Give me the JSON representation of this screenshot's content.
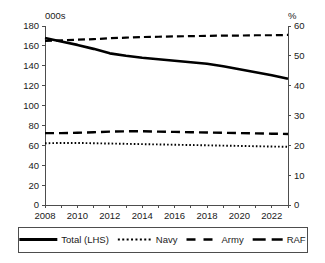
{
  "chart_data": {
    "type": "line",
    "title": "",
    "subtitle": "",
    "xlabel": "",
    "ylabel": "000s",
    "y2label": "%",
    "grid": false,
    "legend_position": "bottom",
    "x": [
      2008,
      2009,
      2010,
      2011,
      2012,
      2013,
      2014,
      2015,
      2016,
      2017,
      2018,
      2019,
      2020,
      2021,
      2022,
      2023
    ],
    "xlim": [
      2008,
      2023
    ],
    "ylim": [
      0,
      180
    ],
    "y2lim": [
      0,
      60
    ],
    "xticklabels": [
      "2008",
      "2010",
      "2012",
      "2014",
      "2016",
      "2018",
      "2020",
      "2022"
    ],
    "xtickvalues": [
      2008,
      2010,
      2012,
      2014,
      2016,
      2018,
      2020,
      2022
    ],
    "yticklabels": [
      "0",
      "20",
      "40",
      "60",
      "80",
      "100",
      "120",
      "140",
      "160",
      "180"
    ],
    "ytickvalues": [
      0,
      20,
      40,
      60,
      80,
      100,
      120,
      140,
      160,
      180
    ],
    "y2ticklabels": [
      "0",
      "10",
      "20",
      "30",
      "40",
      "50",
      "60"
    ],
    "y2tickvalues": [
      0,
      10,
      20,
      30,
      40,
      50,
      60
    ],
    "series": [
      {
        "name": "Total (LHS)",
        "axis": "left",
        "style": "solid",
        "color": "#000000",
        "values": [
          168.0,
          164.5,
          161.0,
          157.0,
          152.5,
          150.0,
          148.0,
          146.5,
          145.0,
          143.5,
          142.0,
          139.5,
          136.5,
          133.5,
          130.5,
          127.0
        ]
      },
      {
        "name": "Navy",
        "axis": "right",
        "style": "dotted",
        "color": "#000000",
        "values": [
          20.7,
          20.8,
          20.8,
          20.7,
          20.6,
          20.5,
          20.4,
          20.3,
          20.2,
          20.1,
          20.0,
          19.9,
          19.8,
          19.7,
          19.6,
          19.5
        ]
      },
      {
        "name": "Army",
        "axis": "right",
        "style": "dashed-long",
        "color": "#000000",
        "values": [
          24.1,
          24.1,
          24.2,
          24.4,
          24.6,
          24.7,
          24.7,
          24.6,
          24.5,
          24.4,
          24.3,
          24.2,
          24.1,
          24.0,
          23.9,
          23.8
        ]
      },
      {
        "name": "RAF",
        "axis": "right",
        "style": "dash-dot",
        "color": "#000000",
        "values": [
          55.0,
          55.2,
          55.4,
          55.6,
          55.9,
          56.1,
          56.3,
          56.4,
          56.5,
          56.6,
          56.7,
          56.8,
          56.8,
          56.9,
          56.9,
          57.0
        ]
      }
    ]
  },
  "legend": {
    "items": [
      {
        "label": "Total (LHS)",
        "style": "solid"
      },
      {
        "label": "Navy",
        "style": "dotted"
      },
      {
        "label": "Army",
        "style": "dashed-long"
      },
      {
        "label": "RAF",
        "style": "dash-dot"
      }
    ]
  }
}
